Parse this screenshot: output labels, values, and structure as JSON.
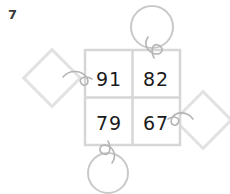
{
  "panel": {
    "label": "7",
    "label_color": "#3a3a3a",
    "background_color": "#ffffff"
  },
  "grid": {
    "name": "number-grid",
    "rows": 2,
    "cols": 2,
    "border_color": "#d6d6d6",
    "digit_color": "#1a1a1a",
    "cells": [
      {
        "row": 0,
        "col": 0,
        "value": "91"
      },
      {
        "row": 0,
        "col": 1,
        "value": "82"
      },
      {
        "row": 1,
        "col": 0,
        "value": "79"
      },
      {
        "row": 1,
        "col": 1,
        "value": "67"
      }
    ]
  },
  "shapes": [
    {
      "id": "top-circle",
      "type": "circle",
      "position": "top",
      "stroke_color": "#c9c9c9"
    },
    {
      "id": "bottom-circle",
      "type": "circle",
      "position": "bottom",
      "stroke_color": "#c9c9c9"
    },
    {
      "id": "left-diamond",
      "type": "diamond",
      "position": "left",
      "stroke_color": "#e0e0e0"
    },
    {
      "id": "right-diamond",
      "type": "diamond",
      "position": "right",
      "stroke_color": "#e0e0e0"
    }
  ],
  "connectors": [
    {
      "id": "top-connector",
      "from": "top-circle",
      "to": "grid-top-edge",
      "stroke_color": "#b0b0b0"
    },
    {
      "id": "bottom-connector",
      "from": "bottom-circle",
      "to": "grid-bottom-edge",
      "stroke_color": "#b0b0b0"
    },
    {
      "id": "left-connector",
      "from": "left-diamond",
      "to": "grid-left-edge",
      "stroke_color": "#b0b0b0"
    },
    {
      "id": "right-connector",
      "from": "right-diamond",
      "to": "grid-right-edge",
      "stroke_color": "#b0b0b0"
    }
  ]
}
